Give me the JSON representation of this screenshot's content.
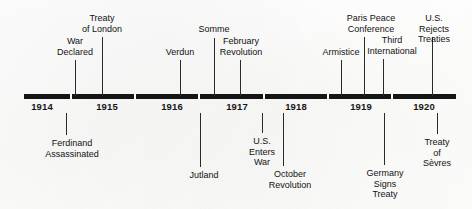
{
  "figure": {
    "axis": {
      "start_year": "1914",
      "end_year": "1920",
      "line_color": "#151515"
    },
    "year_ticks": [
      {
        "label": "1914",
        "x": 42
      },
      {
        "label": "1915",
        "x": 107
      },
      {
        "label": "1916",
        "x": 172
      },
      {
        "label": "1917",
        "x": 237
      },
      {
        "label": "1918",
        "x": 296
      },
      {
        "label": "1919",
        "x": 361
      },
      {
        "label": "1920",
        "x": 424
      }
    ],
    "notches": [
      70,
      134,
      198,
      263,
      327,
      391
    ],
    "events_above": [
      {
        "label": "War\nDeclared",
        "x": 75,
        "text_x": 75,
        "text_top": 36,
        "line_top": 60,
        "line_height": 36
      },
      {
        "label": "Treaty\nof London",
        "x": 102,
        "text_x": 102,
        "text_top": 13,
        "line_top": 37,
        "line_height": 59
      },
      {
        "label": "Verdun",
        "x": 180,
        "text_x": 180,
        "text_top": 47,
        "line_top": 60,
        "line_height": 36
      },
      {
        "label": "Somme",
        "x": 214,
        "text_x": 214,
        "text_top": 24,
        "line_top": 38,
        "line_height": 58
      },
      {
        "label": "February\nRevolution",
        "x": 240,
        "text_x": 241,
        "text_top": 36,
        "line_top": 60,
        "line_height": 36
      },
      {
        "label": "Armistice",
        "x": 341,
        "text_x": 341,
        "text_top": 47,
        "line_top": 60,
        "line_height": 36
      },
      {
        "label": "Paris Peace\nConference",
        "x": 364,
        "text_x": 371,
        "text_top": 13,
        "line_top": 37,
        "line_height": 59
      },
      {
        "label": "Third\nInternational",
        "x": 383,
        "text_x": 392,
        "text_top": 35,
        "line_top": 59,
        "line_height": 37
      },
      {
        "label": "U.S. Rejects\nTreaties",
        "x": 432,
        "text_x": 434,
        "text_top": 13,
        "line_top": 37,
        "line_height": 59
      }
    ],
    "events_below": [
      {
        "label": "Ferdinand\nAssassinated",
        "x": 66,
        "text_x": 72,
        "line_top": 113,
        "line_height": 22,
        "text_top": 138
      },
      {
        "label": "Jutland",
        "x": 200,
        "text_x": 204,
        "line_top": 113,
        "line_height": 54,
        "text_top": 170
      },
      {
        "label": "U.S.\nEnters\nWar",
        "x": 262,
        "text_x": 262,
        "line_top": 113,
        "line_height": 20,
        "text_top": 136
      },
      {
        "label": "October\nRevolution",
        "x": 283,
        "text_x": 290,
        "line_top": 113,
        "line_height": 53,
        "text_top": 169
      },
      {
        "label": "Germany\nSigns\nTreaty",
        "x": 384,
        "text_x": 385,
        "line_top": 113,
        "line_height": 52,
        "text_top": 168
      },
      {
        "label": "Treaty\nof\nSèvres",
        "x": 437,
        "text_x": 437,
        "line_top": 113,
        "line_height": 21,
        "text_top": 137
      }
    ]
  }
}
